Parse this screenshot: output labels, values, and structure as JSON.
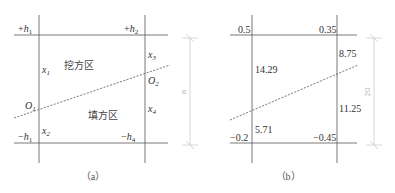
{
  "figure_a": {
    "caption": "（a）",
    "corners": {
      "top_left": {
        "sign": "+",
        "var": "h",
        "sub": "1"
      },
      "top_right": {
        "sign": "+",
        "var": "h",
        "sub": "2"
      },
      "bottom_left": {
        "sign": "−",
        "var": "h",
        "sub": "1"
      },
      "bottom_right": {
        "sign": "−",
        "var": "h",
        "sub": "4"
      }
    },
    "segments": {
      "left_upper": {
        "var": "x",
        "sub": "1"
      },
      "left_lower": {
        "var": "x",
        "sub": "2"
      },
      "right_upper": {
        "var": "x",
        "sub": "3"
      },
      "right_lower": {
        "var": "x",
        "sub": "4"
      }
    },
    "points": {
      "left": {
        "var": "O",
        "sub": "1"
      },
      "right": {
        "var": "O",
        "sub": "2"
      }
    },
    "regions": {
      "cut": "挖方区",
      "fill": "填方区"
    },
    "dimension": "a"
  },
  "figure_b": {
    "caption": "（b）",
    "corners": {
      "top_left": "0.5",
      "top_right": "0.35",
      "bottom_left": "−0.2",
      "bottom_right": "−0.45"
    },
    "segments": {
      "left_upper": "14.29",
      "left_lower": "5.71",
      "right_upper": "8.75",
      "right_lower": "11.25"
    },
    "dimension": "20"
  }
}
